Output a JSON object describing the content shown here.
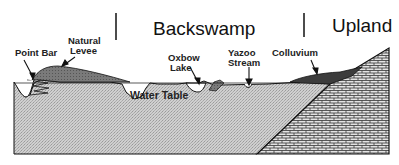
{
  "diagram": {
    "regions": [
      {
        "label": "Backswamp"
      },
      {
        "label": "Upland"
      }
    ],
    "features": [
      {
        "label_line1": "Point Bar"
      },
      {
        "label_line1": "Natural",
        "label_line2": "Levee"
      },
      {
        "label_line1": "Oxbow",
        "label_line2": "Lake"
      },
      {
        "label_line1": "Yazoo",
        "label_line2": "Stream"
      },
      {
        "label_line1": "Colluvium"
      }
    ],
    "water_table_label": "Water Table",
    "colors": {
      "alluvium_fill": "#c8c8c8",
      "levee_fill": "#6e6e6e",
      "colluvium_fill": "#3c3c3c",
      "bedrock_fill": "#d6d6d6",
      "outline": "#111111"
    }
  }
}
